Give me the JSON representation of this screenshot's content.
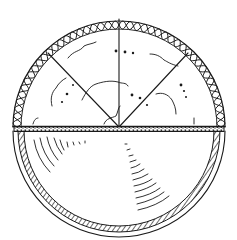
{
  "figure": {
    "title": "Hemispherical dome and bowl cross-section line drawing",
    "colors": {
      "ink": "#1a1a1a",
      "background": "#ffffff"
    },
    "geometry": {
      "center": [
        119,
        127
      ],
      "outer_radius": 106,
      "bowl_ring_radii": [
        106,
        101,
        95
      ],
      "band_y": [
        126,
        132
      ]
    },
    "parts": [
      {
        "id": "dome",
        "label": "upper hemisphere with braided rim, three radial ribs, cracks and dots"
      },
      {
        "id": "band",
        "label": "horizontal stippled band"
      },
      {
        "id": "bowl",
        "label": "lower hemisphere with hatched rim and concentric arc marks"
      }
    ]
  }
}
